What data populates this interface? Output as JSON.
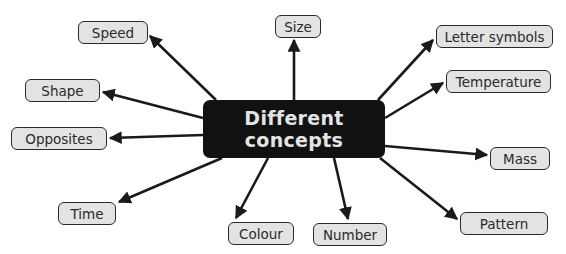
{
  "diagram": {
    "type": "mind-map",
    "center": {
      "lines": [
        "Different",
        "concepts"
      ],
      "box": [
        203,
        100,
        182,
        58
      ],
      "fill": "#111111",
      "text_color": "#e4e4e4"
    },
    "node_style": {
      "fill": "#e3e3e3",
      "border": "#2a2a2a",
      "text_color": "#2a2a2a"
    },
    "arrow_color": "#1a1a1a",
    "nodes": [
      {
        "id": "speed",
        "label": "Speed",
        "box": [
          78,
          21,
          70,
          23
        ],
        "from": [
          216,
          100
        ],
        "to": [
          150,
          36
        ]
      },
      {
        "id": "size",
        "label": "Size",
        "box": [
          275,
          15,
          46,
          23
        ],
        "from": [
          294,
          100
        ],
        "to": [
          294,
          40
        ]
      },
      {
        "id": "letter-symbols",
        "label": "Letter symbols",
        "box": [
          436,
          25,
          117,
          23
        ],
        "from": [
          378,
          100
        ],
        "to": [
          433,
          40
        ]
      },
      {
        "id": "temperature",
        "label": "Temperature",
        "box": [
          446,
          70,
          105,
          23
        ],
        "from": [
          385,
          118
        ],
        "to": [
          443,
          83
        ]
      },
      {
        "id": "shape",
        "label": "Shape",
        "box": [
          25,
          79,
          75,
          23
        ],
        "from": [
          203,
          118
        ],
        "to": [
          103,
          92
        ]
      },
      {
        "id": "opposites",
        "label": "Opposites",
        "box": [
          11,
          127,
          96,
          23
        ],
        "from": [
          203,
          135
        ],
        "to": [
          110,
          138
        ]
      },
      {
        "id": "mass",
        "label": "Mass",
        "box": [
          490,
          147,
          60,
          23
        ],
        "from": [
          385,
          146
        ],
        "to": [
          487,
          155
        ]
      },
      {
        "id": "time",
        "label": "Time",
        "box": [
          58,
          202,
          58,
          23
        ],
        "from": [
          222,
          158
        ],
        "to": [
          119,
          202
        ]
      },
      {
        "id": "pattern",
        "label": "Pattern",
        "box": [
          460,
          212,
          88,
          23
        ],
        "from": [
          380,
          158
        ],
        "to": [
          457,
          219
        ]
      },
      {
        "id": "colour",
        "label": "Colour",
        "box": [
          228,
          222,
          66,
          23
        ],
        "from": [
          268,
          158
        ],
        "to": [
          236,
          218
        ]
      },
      {
        "id": "number",
        "label": "Number",
        "box": [
          313,
          223,
          74,
          23
        ],
        "from": [
          334,
          158
        ],
        "to": [
          348,
          219
        ]
      }
    ]
  }
}
